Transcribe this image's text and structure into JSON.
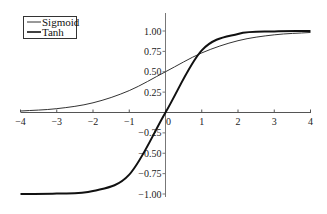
{
  "chart_data": {
    "type": "line",
    "title": "",
    "xlabel": "",
    "ylabel": "",
    "xlim": [
      -4,
      4
    ],
    "ylim": [
      -1.0,
      1.0
    ],
    "grid": false,
    "legend_position": "upper-left",
    "x_ticks": [
      "-4",
      "-3",
      "-2",
      "-1",
      "0",
      "1",
      "2",
      "3",
      "4"
    ],
    "y_ticks": [
      "-1.00",
      "-0.75",
      "-0.50",
      "-0.25",
      "0.25",
      "0.50",
      "0.75",
      "1.00"
    ],
    "series": [
      {
        "name": "Sigmoid",
        "color": "#333333",
        "line_width": 1,
        "x": [
          -4,
          -3,
          -2,
          -1,
          0,
          1,
          2,
          3,
          4
        ],
        "values": [
          0.018,
          0.047,
          0.119,
          0.269,
          0.5,
          0.731,
          0.881,
          0.953,
          0.982
        ]
      },
      {
        "name": "Tanh",
        "color": "#111111",
        "line_width": 2,
        "x": [
          -4,
          -3,
          -2,
          -1,
          0,
          1,
          2,
          3,
          4
        ],
        "values": [
          -0.999,
          -0.995,
          -0.964,
          -0.762,
          0.0,
          0.762,
          0.964,
          0.995,
          0.999
        ]
      }
    ]
  },
  "legend": {
    "items": [
      {
        "label": "Sigmoid"
      },
      {
        "label": "Tanh"
      }
    ]
  }
}
